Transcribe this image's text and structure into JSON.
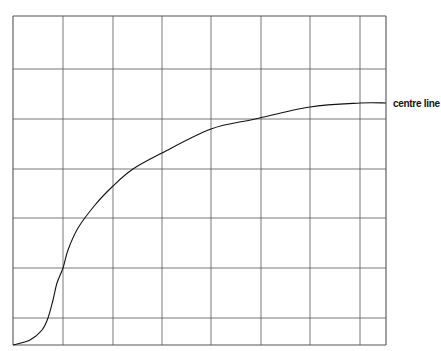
{
  "diagram": {
    "type": "line-on-grid",
    "curve_label": "centre line",
    "colors": {
      "background": "#ffffff",
      "grid": "#555555",
      "curve": "#111111",
      "text": "#111111"
    }
  },
  "chart_data": {
    "type": "line",
    "title": "",
    "xlabel": "",
    "ylabel": "",
    "grid": true,
    "legend": null,
    "annotations": [
      "centre line"
    ],
    "grid_pixels": {
      "x_lines": [
        13,
        63,
        113,
        162,
        211,
        261,
        310,
        360,
        386
      ],
      "y_lines": [
        16,
        69,
        119,
        169,
        218,
        268,
        318,
        345
      ]
    },
    "series": [
      {
        "name": "centre line",
        "points_px": [
          [
            13,
            345
          ],
          [
            30,
            340
          ],
          [
            42,
            330
          ],
          [
            48,
            318
          ],
          [
            53,
            300
          ],
          [
            57,
            283
          ],
          [
            63,
            268
          ],
          [
            68,
            250
          ],
          [
            78,
            228
          ],
          [
            95,
            205
          ],
          [
            113,
            186
          ],
          [
            133,
            169
          ],
          [
            162,
            153
          ],
          [
            211,
            129
          ],
          [
            255,
            119
          ],
          [
            310,
            107
          ],
          [
            360,
            103
          ],
          [
            386,
            103
          ]
        ]
      }
    ]
  }
}
